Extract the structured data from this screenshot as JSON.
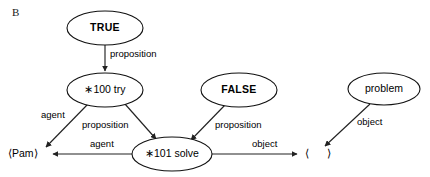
{
  "figure": {
    "panel_label": "B",
    "width": 430,
    "height": 177,
    "background_color": "#ffffff",
    "stroke_color": "#222222",
    "text_color": "#000000"
  },
  "nodes": [
    {
      "id": "true",
      "label": "TRUE",
      "style": "bold",
      "cx": 105,
      "cy": 28,
      "rx": 38,
      "ry": 17
    },
    {
      "id": "try",
      "label": "∗100 try",
      "style": "regular",
      "cx": 105,
      "cy": 90,
      "rx": 38,
      "ry": 17
    },
    {
      "id": "false",
      "label": "FALSE",
      "style": "bold",
      "cx": 239,
      "cy": 90,
      "rx": 38,
      "ry": 17
    },
    {
      "id": "solve",
      "label": "∗101 solve",
      "style": "regular",
      "cx": 172,
      "cy": 154,
      "rx": 40,
      "ry": 17
    },
    {
      "id": "problem",
      "label": "problem",
      "style": "regular",
      "cx": 384,
      "cy": 89,
      "rx": 36,
      "ry": 16
    }
  ],
  "terminals": [
    {
      "id": "pam",
      "label": "⟨Pam⟩",
      "x": 8,
      "y": 154
    },
    {
      "id": "open-bracket",
      "label": "⟨",
      "x": 305,
      "y": 154
    },
    {
      "id": "close-bracket",
      "label": "⟩",
      "x": 327,
      "y": 154
    }
  ],
  "edges": [
    {
      "id": "true-to-try",
      "label": "proposition",
      "from": "true",
      "to": "try",
      "x1": 105,
      "y1": 45,
      "x2": 105,
      "y2": 71,
      "label_x": 110,
      "label_y": 57
    },
    {
      "id": "try-to-pam",
      "label": "agent",
      "from": "try",
      "to": "pam",
      "x1": 88,
      "y1": 104,
      "x2": 46,
      "y2": 147,
      "label_x": 41,
      "label_y": 118
    },
    {
      "id": "try-to-solve",
      "label": "proposition",
      "from": "try",
      "to": "solve",
      "x1": 125,
      "y1": 104,
      "x2": 156,
      "y2": 139,
      "label_x": 82,
      "label_y": 128
    },
    {
      "id": "false-to-solve",
      "label": "proposition",
      "from": "false",
      "to": "solve",
      "x1": 225,
      "y1": 105,
      "x2": 191,
      "y2": 140,
      "label_x": 215,
      "label_y": 128
    },
    {
      "id": "solve-to-pam",
      "label": "agent",
      "from": "solve",
      "to": "pam",
      "x1": 132,
      "y1": 154,
      "x2": 53,
      "y2": 154,
      "label_x": 90,
      "label_y": 147
    },
    {
      "id": "solve-to-bracket",
      "label": "object",
      "from": "solve",
      "to": "open-bracket",
      "x1": 212,
      "y1": 154,
      "x2": 297,
      "y2": 154,
      "label_x": 252,
      "label_y": 147
    },
    {
      "id": "problem-to-bracket",
      "label": "object",
      "from": "problem",
      "to": "open-bracket",
      "x1": 370,
      "y1": 104,
      "x2": 325,
      "y2": 146,
      "label_x": 357,
      "label_y": 125
    }
  ]
}
